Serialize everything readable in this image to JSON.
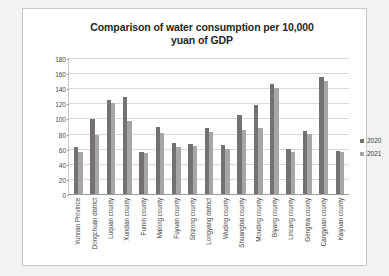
{
  "chart_data": {
    "type": "bar",
    "title": "Comparison of water consumption per 10,000 yuan of GDP",
    "title_line1": "Comparison of water consumption per 10,000",
    "title_line2": "yuan of GDP",
    "xlabel": "",
    "ylabel": "",
    "ylim": [
      0,
      180
    ],
    "ytick_step": 20,
    "yticks": [
      180,
      160,
      140,
      120,
      100,
      80,
      60,
      40,
      20,
      0
    ],
    "grid": true,
    "legend_position": "right",
    "categories": [
      "Yunnan Province",
      "Dongchuan district",
      "Luquan county",
      "Xundian county",
      "Fumin county",
      "Malong county",
      "Fuyuan county",
      "Shizong county",
      "Longyang district",
      "Wuding county",
      "Shuangbai county",
      "Mouding county",
      "Biyang county",
      "Lincang county",
      "Gengma county",
      "Cangyuan county",
      "Kaiyuan county"
    ],
    "series": [
      {
        "name": "2020",
        "color": "#767171",
        "values": [
          62,
          99,
          125,
          128,
          56,
          89,
          67,
          66,
          88,
          65,
          105,
          118,
          145,
          60,
          83,
          155,
          57
        ]
      },
      {
        "name": "2021",
        "color": "#a6a6a6",
        "values": [
          56,
          78,
          120,
          96,
          54,
          81,
          62,
          64,
          82,
          59,
          85,
          87,
          140,
          55,
          80,
          150,
          55
        ]
      }
    ]
  },
  "legend": {
    "items": [
      {
        "label": "2020",
        "color": "#767171"
      },
      {
        "label": "2021",
        "color": "#a6a6a6"
      }
    ]
  }
}
